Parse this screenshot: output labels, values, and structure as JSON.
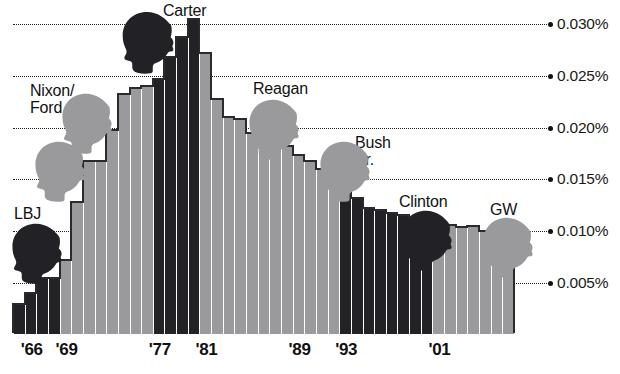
{
  "chart_data": {
    "type": "bar",
    "title": "",
    "subtitle": "",
    "xlabel": "",
    "ylabel": "",
    "ylim": [
      0,
      0.0325
    ],
    "grid": true,
    "legend_position": "none",
    "y_ticks": [
      "0.005%",
      "0.010%",
      "0.015%",
      "0.020%",
      "0.025%",
      "0.030%"
    ],
    "y_tick_values": [
      0.005,
      0.01,
      0.015,
      0.02,
      0.025,
      0.03
    ],
    "x_ticks": [
      "'66",
      "'69",
      "'77",
      "'81",
      "'89",
      "'93",
      "'01"
    ],
    "x_tick_years": [
      1966,
      1969,
      1977,
      1981,
      1989,
      1993,
      2001
    ],
    "categories": [
      1965,
      1966,
      1967,
      1968,
      1969,
      1970,
      1971,
      1972,
      1973,
      1974,
      1975,
      1976,
      1977,
      1978,
      1979,
      1980,
      1981,
      1982,
      1983,
      1984,
      1985,
      1986,
      1987,
      1988,
      1989,
      1990,
      1991,
      1992,
      1993,
      1994,
      1995,
      1996,
      1997,
      1998,
      1999,
      2000,
      2001,
      2002,
      2003,
      2004,
      2005,
      2006,
      2007
    ],
    "values": [
      0.003,
      0.004,
      0.0055,
      0.0055,
      0.0072,
      0.0128,
      0.0168,
      0.0168,
      0.0198,
      0.0232,
      0.0238,
      0.024,
      0.0247,
      0.0268,
      0.0287,
      0.0305,
      0.0272,
      0.0228,
      0.021,
      0.0208,
      0.0195,
      0.0192,
      0.0188,
      0.0182,
      0.0174,
      0.0168,
      0.016,
      0.0152,
      0.0148,
      0.0132,
      0.0122,
      0.012,
      0.0118,
      0.0116,
      0.0112,
      0.011,
      0.0108,
      0.0106,
      0.0104,
      0.0105,
      0.01,
      0.0098,
      0.0104
    ],
    "series": [
      {
        "name": "Federal spending share",
        "values": [
          0.003,
          0.004,
          0.0055,
          0.0055,
          0.0072,
          0.0128,
          0.0168,
          0.0168,
          0.0198,
          0.0232,
          0.0238,
          0.024,
          0.0247,
          0.0268,
          0.0287,
          0.0305,
          0.0272,
          0.0228,
          0.021,
          0.0208,
          0.0195,
          0.0192,
          0.0188,
          0.0182,
          0.0174,
          0.0168,
          0.016,
          0.0152,
          0.0148,
          0.0132,
          0.0122,
          0.012,
          0.0118,
          0.0116,
          0.0112,
          0.011,
          0.0108,
          0.0106,
          0.0104,
          0.0105,
          0.01,
          0.0098,
          0.0104
        ]
      }
    ],
    "bar_shading": [
      "dark",
      "dark",
      "dark",
      "dark",
      "light",
      "light",
      "light",
      "light",
      "light",
      "light",
      "light",
      "light",
      "dark",
      "dark",
      "dark",
      "dark",
      "light",
      "light",
      "light",
      "light",
      "light",
      "light",
      "light",
      "light",
      "light",
      "light",
      "light",
      "light",
      "dark",
      "dark",
      "dark",
      "dark",
      "dark",
      "dark",
      "dark",
      "dark",
      "light",
      "light",
      "light",
      "light",
      "light",
      "light",
      "light"
    ],
    "colors": {
      "dark_bar": "#222226",
      "light_bar": "#9a9a9c",
      "gridline": "#000000",
      "text": "#111111",
      "background": "#ffffff"
    },
    "annotations": [
      {
        "label": "LBJ",
        "head": "dark",
        "name_x": 14,
        "name_y": 205,
        "head_x": 5,
        "head_y": 222,
        "head_w": 62,
        "head_h": 62,
        "flip": false
      },
      {
        "label": "Nixon/\nFord",
        "head": "light",
        "name_x": 30,
        "name_y": 82,
        "head_x": 55,
        "head_y": 92,
        "head_w": 62,
        "head_h": 62,
        "flip": false
      },
      {
        "label": "",
        "head": "light",
        "name_x": 0,
        "name_y": 0,
        "head_x": 28,
        "head_y": 140,
        "head_w": 62,
        "head_h": 62,
        "flip": false
      },
      {
        "label": "Carter",
        "head": "dark",
        "name_x": 163,
        "name_y": 2,
        "head_x": 115,
        "head_y": 10,
        "head_w": 64,
        "head_h": 64,
        "flip": false
      },
      {
        "label": "Reagan",
        "head": "light",
        "name_x": 253,
        "name_y": 80,
        "head_x": 242,
        "head_y": 98,
        "head_w": 62,
        "head_h": 62,
        "flip": false
      },
      {
        "label": "Bush Sr.",
        "head": "light",
        "name_x": 355,
        "name_y": 134,
        "head_x": 313,
        "head_y": 140,
        "head_w": 62,
        "head_h": 62,
        "flip": false
      },
      {
        "label": "Clinton",
        "head": "dark",
        "name_x": 399,
        "name_y": 193,
        "head_x": 395,
        "head_y": 209,
        "head_w": 62,
        "head_h": 62,
        "flip": false
      },
      {
        "label": "GW",
        "head": "light",
        "name_x": 490,
        "name_y": 201,
        "head_x": 476,
        "head_y": 216,
        "head_w": 62,
        "head_h": 62,
        "flip": false
      }
    ]
  }
}
